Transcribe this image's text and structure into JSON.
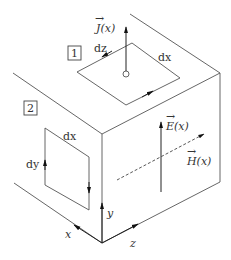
{
  "diagram": {
    "title": "",
    "labels": {
      "J": "J(x)",
      "E": "E(x)",
      "H": "H(x)",
      "loop1_dz": "dz",
      "loop1_dx": "dx",
      "loop2_dx": "dx",
      "loop2_dy": "dy",
      "axis_x": "x",
      "axis_y": "y",
      "axis_z": "z",
      "box1": "1",
      "box2": "2"
    },
    "vector_symbol": "→"
  }
}
